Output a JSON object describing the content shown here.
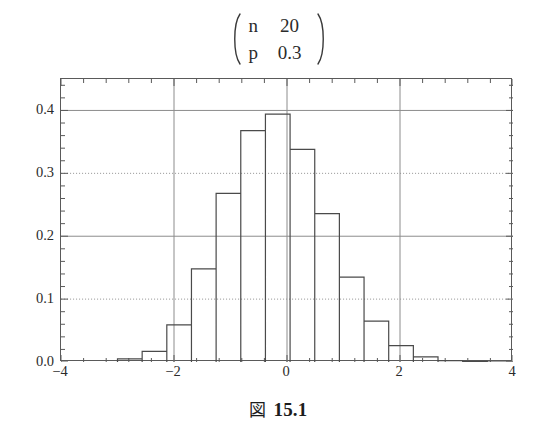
{
  "title": {
    "rows": [
      {
        "symbol": "n",
        "value": "20"
      },
      {
        "symbol": "p",
        "value": "0.3"
      }
    ]
  },
  "caption": {
    "figure_word": "図",
    "number": "15.1"
  },
  "colors": {
    "frame": "#5a5a5a",
    "bar_outline": "#4a4a4a",
    "gridline_major": "#8c8c8c",
    "gridline_dotted": "#9a9a9a",
    "text": "#2b2b2b",
    "background": "#ffffff"
  },
  "chart_data": {
    "type": "bar",
    "subtitle": "",
    "xlabel": "",
    "ylabel": "",
    "xlim": [
      -4,
      4
    ],
    "ylim": [
      0.0,
      0.45
    ],
    "grid": true,
    "legend": null,
    "xticks": [
      -4,
      -2,
      0,
      2,
      4
    ],
    "xtick_labels": [
      "-4",
      "-2",
      "0",
      "2",
      "4"
    ],
    "yticks": [
      0.0,
      0.1,
      0.2,
      0.3,
      0.4
    ],
    "ytick_labels": [
      "0.0",
      "0.1",
      "0.2",
      "0.3",
      "0.4"
    ],
    "minor_tick_count_per_interval": 4,
    "bar_width": 0.4364,
    "bars": [
      {
        "left": -3.0,
        "right": -2.5636,
        "center": -2.7818,
        "height": 0.0008
      },
      {
        "left": -2.5636,
        "right": -2.1273,
        "center": -2.3455,
        "height": 0.0068
      },
      {
        "left": -2.1273,
        "right": -1.6909,
        "center": -1.9091,
        "height": 0.0278
      },
      {
        "left": -1.6909,
        "right": -1.2545,
        "center": -1.4727,
        "height": 0.0716
      },
      {
        "left": -1.2545,
        "right": -0.8182,
        "center": -1.0364,
        "height": 0.1304
      },
      {
        "left": -0.8182,
        "right": -0.3818,
        "center": -0.6,
        "height": 0.1789
      },
      {
        "left": -0.3818,
        "right": 0.0545,
        "center": -0.1636,
        "height": 0.1916
      },
      {
        "left": 0.0545,
        "right": 0.4909,
        "center": 0.2727,
        "height": 0.1643
      },
      {
        "left": 0.4909,
        "right": 0.9273,
        "center": 0.7091,
        "height": 0.1144
      },
      {
        "left": 0.9273,
        "right": 1.3636,
        "center": 1.1455,
        "height": 0.0654
      },
      {
        "left": 1.3636,
        "right": 1.8,
        "center": 1.5818,
        "height": 0.0308
      },
      {
        "left": 1.8,
        "right": 2.2364,
        "center": 2.0182,
        "height": 0.012
      },
      {
        "left": 2.2364,
        "right": 2.6727,
        "center": 2.4545,
        "height": 0.0039
      },
      {
        "left": 2.6727,
        "right": 3.1091,
        "center": 2.8909,
        "height": 0.001
      },
      {
        "left": 3.1091,
        "right": 3.5455,
        "center": 3.3273,
        "height": 0.0002
      },
      {
        "left": 3.5455,
        "right": 3.9818,
        "center": 3.7636,
        "height": 0.0
      }
    ],
    "plotted_heights": [
      0.005,
      0.017,
      0.059,
      0.148,
      0.268,
      0.368,
      0.394,
      0.338,
      0.236,
      0.135,
      0.065,
      0.026,
      0.008,
      0.002,
      0.001,
      0.0
    ],
    "plotted_lefts": [
      -3.0,
      -2.5636,
      -2.1273,
      -1.6909,
      -1.2545,
      -0.8182,
      -0.3818,
      0.0545,
      0.4909,
      0.9273,
      1.3636,
      1.8,
      2.2364,
      2.6727,
      3.1091,
      3.5455
    ]
  }
}
